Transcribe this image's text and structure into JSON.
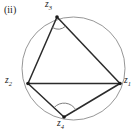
{
  "figure": {
    "panel_tag": "(ii)",
    "caption": "",
    "background_color": "#ffffff",
    "circle_color": "#8a8a8a",
    "chord_color": "#2b2b2b",
    "arc_color": "#6f6f6f",
    "label_color": "#1b1b1b",
    "circle": {
      "cx": 73.5,
      "cy": 68.5,
      "r": 51.5
    },
    "vertices": [
      {
        "id": "z1",
        "label": "z",
        "subscript": "1",
        "x": 120,
        "y": 83.5,
        "label_x": 124,
        "label_y": 76
      },
      {
        "id": "z2",
        "label": "z",
        "subscript": "2",
        "x": 28,
        "y": 83.5,
        "label_x": 5,
        "label_y": 76
      },
      {
        "id": "z3",
        "label": "z",
        "subscript": "3",
        "x": 57,
        "y": 17,
        "label_x": 45,
        "label_y": 0
      },
      {
        "id": "z4",
        "label": "z",
        "subscript": "4",
        "x": 64,
        "y": 117,
        "label_x": 57,
        "label_y": 119
      }
    ],
    "segments": [
      {
        "id": "seg-z3-z1",
        "from": "z3",
        "to": "z1"
      },
      {
        "id": "seg-z3-z2",
        "from": "z3",
        "to": "z2"
      },
      {
        "id": "seg-z2-z1",
        "from": "z2",
        "to": "z1"
      },
      {
        "id": "seg-z2-z4",
        "from": "z2",
        "to": "z4"
      },
      {
        "id": "seg-z4-z1",
        "from": "z4",
        "to": "z1"
      }
    ],
    "angle_marks": [
      {
        "id": "angle-at-z3",
        "at": "z3",
        "type": "arc",
        "reflex": false
      },
      {
        "id": "angle-at-z4",
        "at": "z4",
        "type": "arc",
        "reflex": true
      }
    ]
  }
}
